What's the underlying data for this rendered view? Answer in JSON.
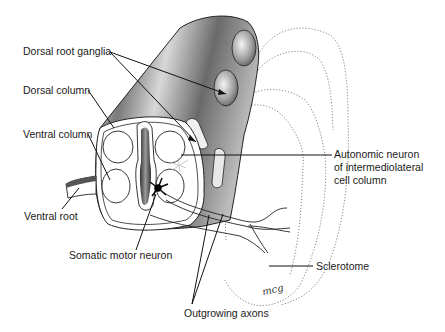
{
  "figure": {
    "labels": {
      "dorsal_root_ganglia": "Dorsal root ganglia",
      "dorsal_column": "Dorsal column",
      "ventral_column": "Ventral column",
      "ventral_root": "Ventral root",
      "somatic_motor_neuron": "Somatic motor neuron",
      "outgrowing_axons": "Outgrowing axons",
      "sclerotome": "Sclerotome",
      "autonomic_neuron_line1": "Autonomic neuron",
      "autonomic_neuron_line2": "of intermediolateral",
      "autonomic_neuron_line3": "cell column"
    },
    "signature": "mcg"
  }
}
